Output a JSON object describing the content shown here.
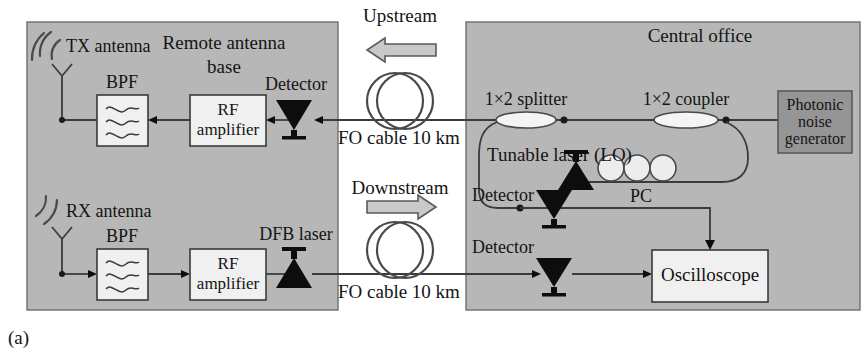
{
  "figure": {
    "caption": "(a)",
    "background_color": "#ffffff",
    "panel_color": "#b7b7b7",
    "dark_block_color": "#959595",
    "light_block_color": "#f0f0f0"
  },
  "panels": {
    "remote": {
      "title_line1": "Remote antenna",
      "title_line2": "base"
    },
    "central": {
      "title": "Central office"
    }
  },
  "remote_site": {
    "tx_antenna_label": "TX antenna",
    "rx_antenna_label": "RX antenna",
    "tx_bpf_label": "BPF",
    "rx_bpf_label": "BPF",
    "tx_amp_line1": "RF",
    "tx_amp_line2": "amplifier",
    "rx_amp_line1": "RF",
    "rx_amp_line2": "amplifier",
    "detector_label": "Detector",
    "dfb_label": "DFB laser"
  },
  "links": {
    "upstream_label": "Upstream",
    "downstream_label": "Downstream",
    "upstream_cable_label": "FO cable 10 km",
    "downstream_cable_label": "FO cable 10 km"
  },
  "central_office": {
    "splitter_label": "1×2 splitter",
    "coupler_label": "1×2 coupler",
    "noise_gen_line1": "Photonic",
    "noise_gen_line2": "noise",
    "noise_gen_line3": "generator",
    "tunable_laser_label": "Tunable laser (LO)",
    "pc_label": "PC",
    "detector_lo_label": "Detector",
    "detector_down_label": "Detector",
    "oscilloscope_label": "Oscilloscope"
  }
}
